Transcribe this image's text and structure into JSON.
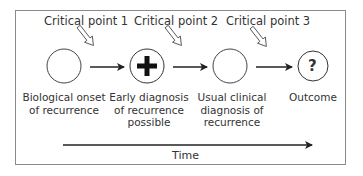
{
  "diagram": {
    "critical_points": [
      {
        "label": "Critical point 1"
      },
      {
        "label": "Critical point 2"
      },
      {
        "label": "Critical point 3"
      }
    ],
    "stages": [
      {
        "symbol": "",
        "label_lines": [
          "Biological onset",
          "of recurrence"
        ]
      },
      {
        "symbol": "+",
        "label_lines": [
          "Early diagnosis",
          "of recurrence",
          "possible"
        ]
      },
      {
        "symbol": "",
        "label_lines": [
          "Usual clinical",
          "diagnosis of",
          "recurrence"
        ]
      },
      {
        "symbol": "?",
        "label_lines": [
          "Outcome"
        ]
      }
    ],
    "time_axis": {
      "label": "Time"
    },
    "colors": {
      "stroke": "#222222",
      "frame": "#8a8a8a",
      "background": "#ffffff"
    }
  }
}
